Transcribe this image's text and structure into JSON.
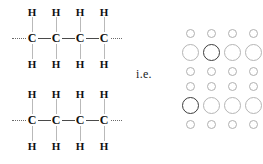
{
  "figure": {
    "title_text": "",
    "connector_label": "i.e.",
    "background_color": "#ffffff"
  },
  "chains": [
    {
      "id": "chain-top",
      "name": "polyethylene-chain-upper",
      "backbone_label": "C",
      "hydrogen_label": "H",
      "carbon_count": 4,
      "top_hydrogens": [
        "H",
        "H",
        "H",
        "H"
      ],
      "bottom_hydrogens": [
        "H",
        "H",
        "H",
        "H"
      ],
      "carbons": [
        "C",
        "C",
        "C",
        "C"
      ],
      "left_continuation": "dashed",
      "right_continuation": "dashed"
    },
    {
      "id": "chain-bottom",
      "name": "polyethylene-chain-lower",
      "backbone_label": "C",
      "hydrogen_label": "H",
      "carbon_count": 4,
      "top_hydrogens": [
        "H",
        "H",
        "H",
        "H"
      ],
      "bottom_hydrogens": [
        "H",
        "H",
        "H",
        "H"
      ],
      "carbons": [
        "C",
        "C",
        "C",
        "C"
      ],
      "left_continuation": "dashed",
      "right_continuation": "dashed"
    }
  ],
  "space_filling_model": {
    "name": "space-filling-circle-grid",
    "columns": 4,
    "rows": [
      {
        "index": 0,
        "size": "small",
        "count": 4,
        "emphasis": [
          false,
          false,
          false,
          false
        ]
      },
      {
        "index": 1,
        "size": "large",
        "count": 4,
        "emphasis": [
          false,
          true,
          false,
          false
        ]
      },
      {
        "index": 2,
        "size": "small",
        "count": 4,
        "emphasis": [
          false,
          false,
          false,
          false
        ]
      },
      {
        "index": 3,
        "size": "small",
        "count": 4,
        "emphasis": [
          false,
          false,
          false,
          false
        ]
      },
      {
        "index": 4,
        "size": "large",
        "count": 4,
        "emphasis": [
          true,
          false,
          false,
          false
        ]
      },
      {
        "index": 5,
        "size": "small",
        "count": 4,
        "emphasis": [
          false,
          false,
          false,
          false
        ]
      }
    ],
    "small_circle_color": "#b0b0b0",
    "large_circle_color": "#b5b5b5",
    "emphasis_circle_color": "#3d3d3d"
  },
  "colors": {
    "atom_text": "#101010",
    "carbon_bond": "#4a4a4a",
    "hydrogen_bond": "#b9b9b9",
    "dashed_line": "#6a6a6a"
  }
}
